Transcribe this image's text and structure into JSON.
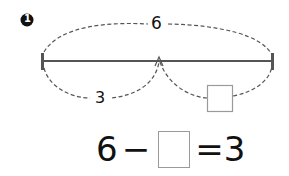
{
  "problem": {
    "number": "1",
    "diagram": {
      "total_label": "6",
      "part_label": "3",
      "unknown_box": ""
    },
    "equation": {
      "minuend": "6",
      "operator": "−",
      "unknown": "",
      "equals": "=",
      "result": "3"
    }
  }
}
